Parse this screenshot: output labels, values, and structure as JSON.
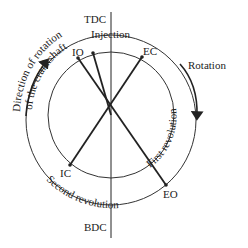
{
  "diagram": {
    "labels": {
      "tdc": "TDC",
      "bdc": "BDC",
      "injection": "Injection",
      "io": "IO",
      "ec": "EC",
      "ic": "IC",
      "eo": "EO",
      "rotation": "Rotation",
      "direction_line1": "Direction of rotation",
      "direction_line2": "of the crankshaft",
      "first_revolution": "First revolution",
      "second_revolution": "Second revolution"
    },
    "colors": {
      "stroke": "#222222",
      "background": "#ffffff"
    }
  }
}
